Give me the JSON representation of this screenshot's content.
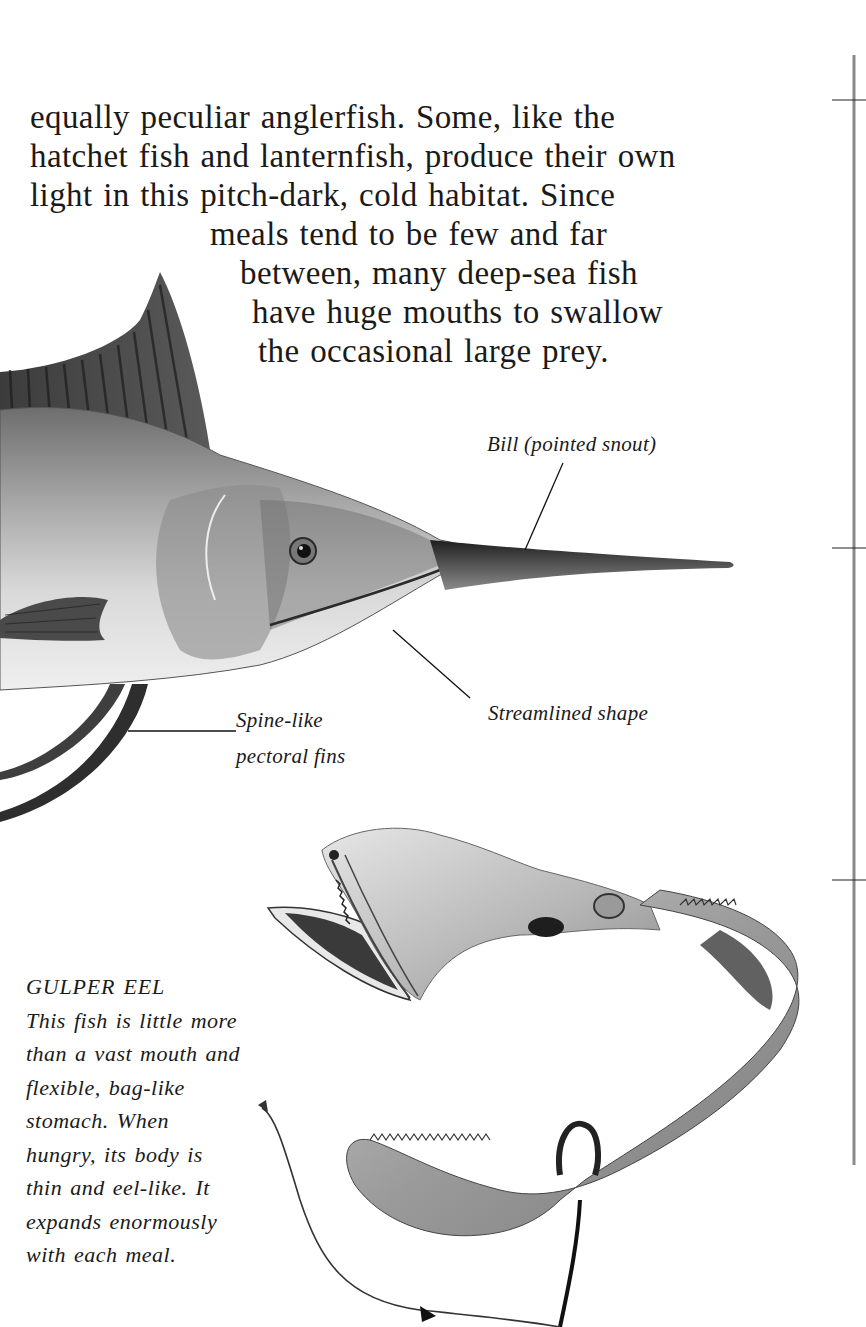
{
  "body_text": {
    "lines": [
      "equally peculiar anglerfish. Some, like the",
      "hatchet fish and lanternfish, produce their own",
      "light in this pitch-dark, cold habitat. Since",
      "meals tend to be few and far",
      "between, many deep-sea fish",
      "have huge mouths to swallow",
      "the occasional large prey."
    ]
  },
  "swordfish": {
    "name": "swordfish-illustration",
    "labels": {
      "bill": "Bill (pointed snout)",
      "streamlined": "Streamlined shape",
      "fins_line1": "Spine-like",
      "fins_line2": "pectoral fins"
    }
  },
  "gulper_eel": {
    "heading": "GULPER EEL",
    "caption_lines": [
      "This fish is little more",
      "than a vast mouth and",
      "flexible, bag-like",
      "stomach. When",
      "hungry, its body is",
      "thin and eel-like. It",
      "expands enormously",
      "with each meal."
    ]
  },
  "depth_scale": {
    "tick_count": 3
  },
  "colors": {
    "ink": "#1a1a1a",
    "background": "#ffffff",
    "scale_line": "#8a8a8a"
  }
}
